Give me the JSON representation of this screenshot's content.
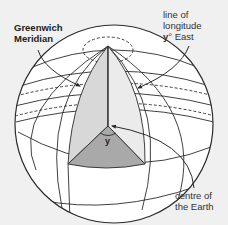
{
  "diagram": {
    "labels": {
      "greenwich": [
        "Greenwich",
        "Meridian"
      ],
      "longitude": [
        "line of",
        "longitude",
        "y° East"
      ],
      "longitude_y": "y",
      "longitude_rest": "° East",
      "centre": [
        "centre of",
        "the Earth"
      ],
      "angle": "y"
    },
    "colors": {
      "background": "#f0f0f0",
      "sphere_fill": "#ffffff",
      "outline": "#2b2b2b",
      "wedge_left": "#d8d8d8",
      "wedge_right": "#ebebeb",
      "wedge_base": "#a9a9a9"
    },
    "elements": [
      "globe",
      "polar cap (dashed)",
      "Greenwich meridian arc",
      "meridian at y° East arc",
      "wedge cut to centre",
      "angle y at centre",
      "parallels of latitude (dashed on far side)"
    ]
  }
}
